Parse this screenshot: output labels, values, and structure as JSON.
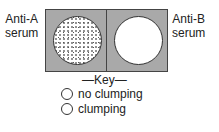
{
  "labels": {
    "left": [
      "Anti-A",
      "serum"
    ],
    "right": [
      "Anti-B",
      "serum"
    ]
  },
  "panels": [
    {
      "serum": "Anti-A",
      "result": "clumping"
    },
    {
      "serum": "Anti-B",
      "result": "no clumping"
    }
  ],
  "key": {
    "title": "—Key—",
    "items": [
      {
        "symbol": "open-circle-icon",
        "label": "no clumping"
      },
      {
        "symbol": "dotted-circle-icon",
        "label": "clumping"
      }
    ]
  },
  "colors": {
    "panel_bg": "#a9a9a9",
    "border": "#444444",
    "circle_fill": "#ffffff"
  }
}
